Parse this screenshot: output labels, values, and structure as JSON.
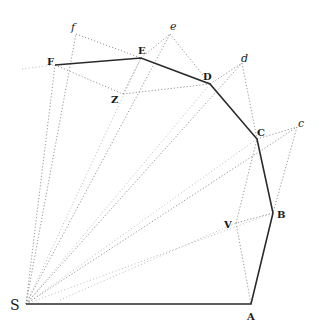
{
  "figure": {
    "labels": {
      "S": "S",
      "A": "A",
      "B": "B",
      "C": "C",
      "D": "D",
      "E": "E",
      "F": "F",
      "V": "V",
      "Z": "Z",
      "c": "c",
      "d": "d",
      "e": "e",
      "f": "f"
    },
    "points": {
      "S": [
        26,
        304
      ],
      "A": [
        251,
        304
      ],
      "B": [
        273,
        213
      ],
      "C": [
        257,
        139
      ],
      "D": [
        210,
        84
      ],
      "E": [
        141,
        58
      ],
      "F": [
        55,
        65
      ],
      "V": [
        236,
        223
      ],
      "Z": [
        123,
        94
      ],
      "c": [
        297,
        127
      ],
      "d": [
        242,
        63
      ],
      "e": [
        170,
        34
      ],
      "f": [
        76,
        34
      ]
    },
    "colors": {
      "solid_line": "#2a2a2a",
      "dotted_line": "#8a8a8a",
      "background": "#ffffff"
    }
  }
}
